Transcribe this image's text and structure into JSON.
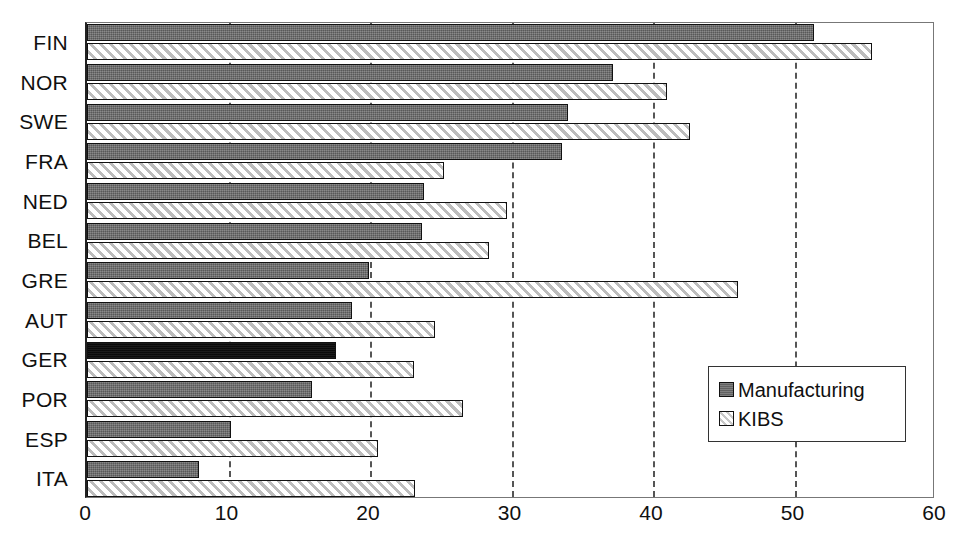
{
  "chart_data": {
    "type": "bar",
    "orientation": "horizontal",
    "title": "",
    "xlabel": "",
    "ylabel": "",
    "xlim": [
      0,
      60
    ],
    "xticks": [
      0,
      10,
      20,
      30,
      40,
      50,
      60
    ],
    "gridlines": [
      10,
      20,
      30,
      40,
      50
    ],
    "grid": true,
    "legend_position": "inside-right",
    "categories": [
      "FIN",
      "NOR",
      "SWE",
      "FRA",
      "NED",
      "BEL",
      "GRE",
      "AUT",
      "GER",
      "POR",
      "ESP",
      "ITA"
    ],
    "series": [
      {
        "name": "Manufacturing",
        "color": "#6e6e6e",
        "values": [
          51.4,
          37.2,
          34.0,
          33.6,
          23.8,
          23.7,
          19.9,
          18.7,
          17.6,
          15.9,
          10.2,
          7.9
        ]
      },
      {
        "name": "KIBS",
        "color": "#f2f2f2",
        "values": [
          55.5,
          41.0,
          42.6,
          25.2,
          29.7,
          28.4,
          46.0,
          24.6,
          23.1,
          26.6,
          20.6,
          23.2
        ]
      }
    ]
  },
  "legend": {
    "items": [
      {
        "label": "Manufacturing",
        "swatch": "mfg"
      },
      {
        "label": "KIBS",
        "swatch": "kibs"
      }
    ]
  },
  "axis": {
    "x_tick_labels": [
      "0",
      "10",
      "20",
      "30",
      "40",
      "50",
      "60"
    ],
    "y_tick_labels": [
      "FIN",
      "NOR",
      "SWE",
      "FRA",
      "NED",
      "BEL",
      "GRE",
      "AUT",
      "GER",
      "POR",
      "ESP",
      "ITA"
    ]
  },
  "style": {
    "dark_row_index": 8
  }
}
